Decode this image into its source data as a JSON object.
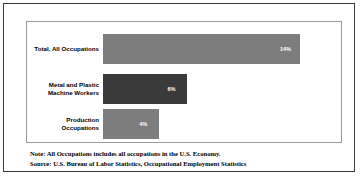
{
  "chart_data": {
    "type": "bar",
    "orientation": "horizontal",
    "title": "",
    "xlabel": "",
    "ylabel": "",
    "xlim": [
      0,
      16
    ],
    "grid": false,
    "legend": null,
    "categories": [
      "Total, All Occupations",
      "Metal and Plastic\nMachine Workers",
      "Production\nOccupations"
    ],
    "values": [
      14,
      6,
      4
    ],
    "value_labels": [
      "14%",
      "6%",
      "4%"
    ],
    "bar_colors": [
      "#7d7d7d",
      "#3a3a3a",
      "#7d7d7d"
    ]
  },
  "footnotes": {
    "note": "Note: All Occupations includes all occupations in the U.S. Economy.",
    "source": "Source: U.S. Bureau of Labor Statistics, Occupational Employment Statistics"
  },
  "colors": {
    "outer_frame": "#3a3a3a",
    "plot_border": "#9a9a9a",
    "background": "#ffffff",
    "value_label": "#ffffff",
    "category_label": "#000000"
  }
}
